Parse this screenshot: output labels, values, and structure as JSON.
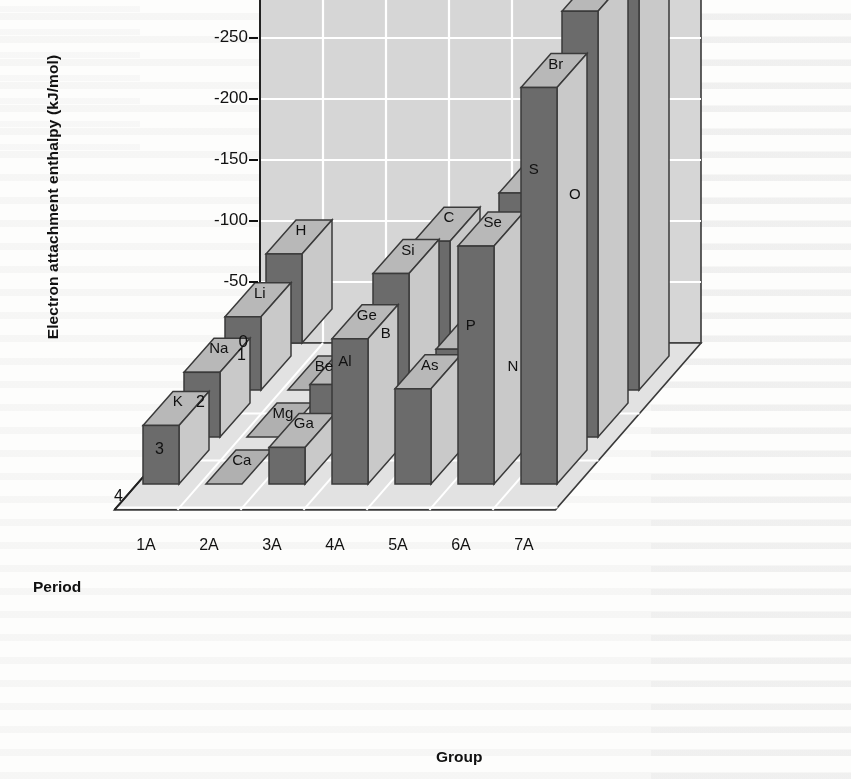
{
  "figure": {
    "kind": "3d-bar-chart",
    "y_axis_title": "Electron attachment enthalpy (kJ/mol)",
    "x_axis_title": "Group",
    "z_axis_title": "Period"
  },
  "chart_data": {
    "type": "bar",
    "title": "Electron attachment enthalpy (kJ/mol)",
    "xlabel": "Group",
    "ylabel": "Electron attachment enthalpy (kJ/mol)",
    "zlabel": "Period",
    "projection": "3d-isometric",
    "grid": true,
    "legend": "none",
    "categories": [
      "1A",
      "2A",
      "3A",
      "4A",
      "5A",
      "6A",
      "7A"
    ],
    "depth_categories": [
      "1",
      "2",
      "3",
      "4"
    ],
    "ylim": [
      0,
      -350
    ],
    "yticks": [
      0,
      -50,
      -100,
      -150,
      -200,
      -250,
      -300,
      -350
    ],
    "ytick_labels": [
      "0",
      "-50",
      "-100",
      "-150",
      "-200",
      "-250",
      "-300",
      "-350"
    ],
    "value_unit": "kJ/mol",
    "note": "Bars are drawn downward from 0; more negative = taller bar. Group 2A (Be, Mg, Ca) and period-2 group 5A (N) are essentially zero and appear as flat tiles.",
    "series": [
      {
        "name": "Period 1",
        "period": "1",
        "points": [
          {
            "group": "1A",
            "element": "H",
            "value": -73
          }
        ]
      },
      {
        "name": "Period 2",
        "period": "2",
        "points": [
          {
            "group": "1A",
            "element": "Li",
            "value": -60
          },
          {
            "group": "2A",
            "element": "Be",
            "value": 0
          },
          {
            "group": "3A",
            "element": "B",
            "value": -27
          },
          {
            "group": "4A",
            "element": "C",
            "value": -122
          },
          {
            "group": "5A",
            "element": "N",
            "value": 0
          },
          {
            "group": "6A",
            "element": "O",
            "value": -141
          },
          {
            "group": "7A",
            "element": "F",
            "value": -328
          }
        ]
      },
      {
        "name": "Period 3",
        "period": "3",
        "points": [
          {
            "group": "1A",
            "element": "Na",
            "value": -53
          },
          {
            "group": "2A",
            "element": "Mg",
            "value": 0
          },
          {
            "group": "3A",
            "element": "Al",
            "value": -43
          },
          {
            "group": "4A",
            "element": "Si",
            "value": -134
          },
          {
            "group": "5A",
            "element": "P",
            "value": -72
          },
          {
            "group": "6A",
            "element": "S",
            "value": -200
          },
          {
            "group": "7A",
            "element": "Cl",
            "value": -349
          }
        ]
      },
      {
        "name": "Period 4",
        "period": "4",
        "points": [
          {
            "group": "1A",
            "element": "K",
            "value": -48
          },
          {
            "group": "2A",
            "element": "Ca",
            "value": 0
          },
          {
            "group": "3A",
            "element": "Ga",
            "value": -30
          },
          {
            "group": "4A",
            "element": "Ge",
            "value": -119
          },
          {
            "group": "5A",
            "element": "As",
            "value": -78
          },
          {
            "group": "6A",
            "element": "Se",
            "value": -195
          },
          {
            "group": "7A",
            "element": "Br",
            "value": -325
          }
        ]
      }
    ]
  },
  "colors": {
    "wall": "#d6d6d6",
    "floor": "#e2e2e2",
    "gridline": "#ffffff",
    "bar_front": "#6b6b6b",
    "bar_top": "#b8b8b8",
    "bar_side": "#c9c9c9",
    "bar_flat": "#b0b0b0",
    "outline": "#3a3a3a",
    "text": "#111111",
    "page": "#fdfdfc"
  }
}
